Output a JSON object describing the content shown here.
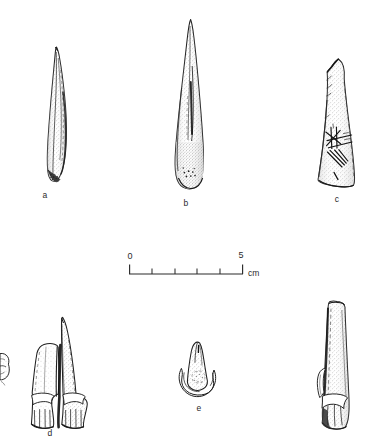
{
  "figure": {
    "kind": "archaeological-artifact-plate",
    "background_color": "#ffffff",
    "ink_color": "#1f1f1f",
    "stipple_color": "#7c7c7c",
    "artifact_count": 6,
    "labelled_count": 5
  },
  "artifacts": [
    {
      "id": "a",
      "label": "a",
      "name": "slender-bone-awl",
      "description": "long narrow pointed bone awl, tip at upper left, splintered base",
      "label_x": 45,
      "label_y": 196,
      "bounds": {
        "x": 40,
        "y": 46,
        "width": 30,
        "height": 136
      }
    },
    {
      "id": "b",
      "label": "b",
      "name": "tapered-bone-point",
      "description": "elongated conical bone point, broad rounded stippled base with small drilled dots",
      "label_x": 186,
      "label_y": 204,
      "bounds": {
        "x": 172,
        "y": 18,
        "width": 36,
        "height": 172
      }
    },
    {
      "id": "c",
      "label": "c",
      "name": "incised-bone-fragment",
      "description": "tapered bone fragment with incised cross-hatched lattice marks on lower face",
      "label_x": 337,
      "label_y": 200,
      "bounds": {
        "x": 308,
        "y": 58,
        "width": 48,
        "height": 130
      }
    },
    {
      "id": "d",
      "label": "d",
      "name": "split-bone-double-point",
      "description": "split metapodial forming a paired double point with grooved central channel",
      "label_x": 50,
      "label_y": 434,
      "bounds": {
        "x": 30,
        "y": 316,
        "width": 60,
        "height": 112
      }
    },
    {
      "id": "e",
      "label": "e",
      "name": "small-hooded-point",
      "description": "small leaf-shaped point set on a crescentic hooded base",
      "label_x": 199,
      "label_y": 409,
      "bounds": {
        "x": 178,
        "y": 342,
        "width": 42,
        "height": 56
      }
    },
    {
      "id": "f",
      "label": "",
      "name": "unlabelled-bone-point-right",
      "description": "long narrow bone point with flared notched base, unlabelled, at right margin",
      "label_x": 0,
      "label_y": 0,
      "bounds": {
        "x": 316,
        "y": 300,
        "width": 34,
        "height": 130
      }
    },
    {
      "id": "edge",
      "label": "",
      "name": "cropped-edge-fragment",
      "description": "small fragment cropped at the left page margin",
      "label_x": 0,
      "label_y": 0,
      "bounds": {
        "x": 0,
        "y": 352,
        "width": 10,
        "height": 34
      }
    }
  ],
  "scale_bar": {
    "name": "scale-bar",
    "start_label": "0",
    "end_label": "5",
    "unit": "cm",
    "start_x": 129,
    "end_x": 243,
    "baseline_y": 274,
    "tick_count": 6,
    "minor_ticks": 4,
    "start_label_x": 129,
    "start_label_y": 257,
    "end_label_x": 240,
    "end_label_y": 256,
    "unit_x": 249,
    "unit_y": 268,
    "ticks": [
      {
        "value": "0",
        "x": 129
      },
      {
        "value": "1",
        "x": 152
      },
      {
        "value": "2",
        "x": 175
      },
      {
        "value": "3",
        "x": 197
      },
      {
        "value": "4",
        "x": 220
      },
      {
        "value": "5",
        "x": 243
      }
    ]
  }
}
